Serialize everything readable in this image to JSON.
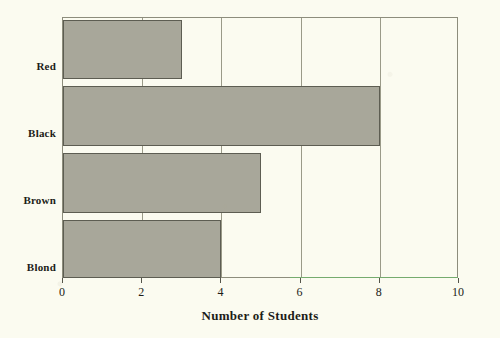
{
  "chart_data": {
    "type": "bar",
    "orientation": "horizontal",
    "title": "",
    "xlabel": "Number of Students",
    "ylabel": "",
    "categories": [
      "Red",
      "Black",
      "Brown",
      "Blond"
    ],
    "values": [
      3,
      8,
      5,
      4
    ],
    "series": [
      {
        "name": "Number of Students",
        "values": [
          3,
          8,
          5,
          4
        ]
      }
    ],
    "xlim": [
      0,
      10
    ],
    "ylim": null,
    "xticks": [
      0,
      2,
      4,
      6,
      8,
      10
    ],
    "xtick_labels": [
      "0",
      "2",
      "4",
      "6",
      "8",
      "10"
    ],
    "grid": "vertical",
    "legend": null,
    "legend_position": "none",
    "annotations": [],
    "colors": {
      "bar_fill": "#a8a79a",
      "bar_edge": "#5d5d52",
      "gridline": "#9a9a88",
      "frame": "#8d8d7c",
      "background": "#fbfbf0",
      "text": "#1d1d18",
      "axis_tint": "#63c463"
    }
  }
}
